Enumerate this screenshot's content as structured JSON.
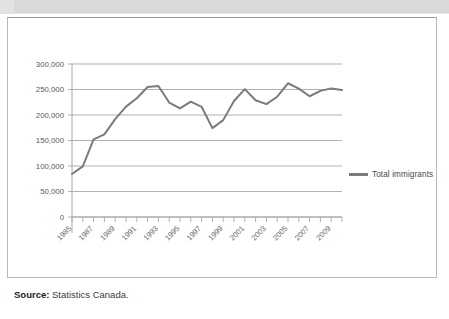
{
  "figure": {
    "source_label": "Source:",
    "source_text": "Statistics Canada."
  },
  "legend": {
    "entries": [
      {
        "label": "Total immigrants",
        "color": "#7b7b7b"
      }
    ]
  },
  "chart_data": {
    "type": "line",
    "title": "",
    "xlabel": "",
    "ylabel": "",
    "ylim": [
      0,
      300000
    ],
    "xlim": [
      1985,
      2010
    ],
    "grid": true,
    "legend_position": "right",
    "ytick_labels": [
      "300,000",
      "250,000",
      "200,000",
      "150,000",
      "100,000",
      "50,000",
      "0"
    ],
    "ytick_values": [
      300000,
      250000,
      200000,
      150000,
      100000,
      50000,
      0
    ],
    "xtick_labels": [
      "1985",
      "1987",
      "1989",
      "1991",
      "1993",
      "1995",
      "1997",
      "1999",
      "2001",
      "2003",
      "2005",
      "2007",
      "2009"
    ],
    "xtick_values": [
      1985,
      1987,
      1989,
      1991,
      1993,
      1995,
      1997,
      1999,
      2001,
      2003,
      2005,
      2007,
      2009
    ],
    "x": [
      1985,
      1986,
      1987,
      1988,
      1989,
      1990,
      1991,
      1992,
      1993,
      1994,
      1995,
      1996,
      1997,
      1998,
      1999,
      2000,
      2001,
      2002,
      2003,
      2004,
      2005,
      2006,
      2007,
      2008,
      2009,
      2010
    ],
    "series": [
      {
        "name": "Total immigrants",
        "color": "#7b7b7b",
        "values": [
          84302,
          99219,
          152098,
          161929,
          192001,
          216452,
          232744,
          254817,
          256741,
          224364,
          212859,
          226071,
          216038,
          174195,
          189951,
          227455,
          250638,
          229048,
          221349,
          235823,
          262241,
          251640,
          236753,
          247246,
          252172,
          249000
        ]
      }
    ]
  }
}
